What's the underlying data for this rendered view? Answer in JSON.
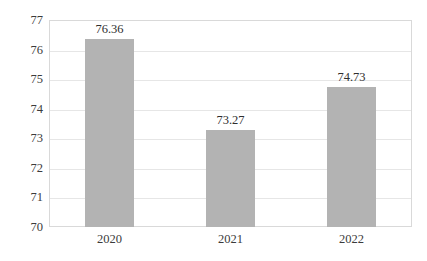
{
  "chart_data": {
    "type": "bar",
    "title": "",
    "subtitle": "",
    "xlabel": "",
    "ylabel": "",
    "categories": [
      "2020",
      "2021",
      "2022"
    ],
    "values": [
      76.36,
      73.27,
      74.73
    ],
    "data_labels": [
      "76.36",
      "73.27",
      "74.73"
    ],
    "ylim": [
      70,
      77
    ],
    "y_ticks": [
      77,
      76,
      75,
      74,
      73,
      72,
      71,
      70
    ],
    "y_tick_labels": [
      "77",
      "76",
      "75",
      "74",
      "73",
      "72",
      "71",
      "70"
    ],
    "grid": true,
    "grid_axis": "y",
    "legend": false,
    "legend_position": "none",
    "series": [
      {
        "name": "",
        "values": [
          76.36,
          73.27,
          74.73
        ],
        "color": "#b3b3b3"
      }
    ],
    "colors": {
      "bar_fill": "#b3b3b3",
      "gridline": "#e6e6e6",
      "plot_border": "#d9d9d9",
      "tick_text": "#3b3b3b",
      "label_text": "#2e2e2e",
      "background": "#ffffff"
    }
  }
}
